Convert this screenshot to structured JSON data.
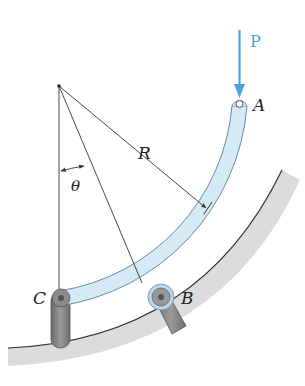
{
  "figure": {
    "type": "mechanics-diagram",
    "labels": {
      "load": "P",
      "point_a": "A",
      "point_b": "B",
      "point_c": "C",
      "radius": "R",
      "angle": "θ"
    },
    "colors": {
      "load_arrow": "#4aa3df",
      "bar_fill": "#d6eaf5",
      "bar_edge": "#5f8fb0",
      "ground": "#d9d9d9",
      "support": "#7a7a7a",
      "line": "#333333"
    }
  }
}
